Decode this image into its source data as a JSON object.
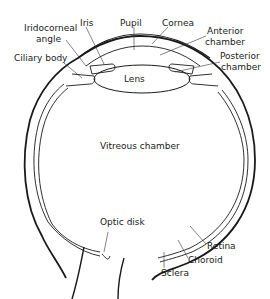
{
  "diagram": {
    "labels": {
      "iridocorneal_angle_line1": "Iridocorneal",
      "iridocorneal_angle_line2": "angle",
      "iris": "Iris",
      "pupil": "Pupil",
      "cornea": "Cornea",
      "anterior_chamber_line1": "Anterior",
      "anterior_chamber_line2": "chamber",
      "posterior_chamber_line1": "Posterior",
      "posterior_chamber_line2": "chamber",
      "ciliary_body": "Ciliary body",
      "lens": "Lens",
      "vitreous_chamber": "Vitreous chamber",
      "optic_disk": "Optic disk",
      "retina": "Retina",
      "choroid": "Choroid",
      "sclera": "Sclera"
    },
    "colors": {
      "line": "#1a1a1a",
      "background": "#ffffff"
    }
  }
}
